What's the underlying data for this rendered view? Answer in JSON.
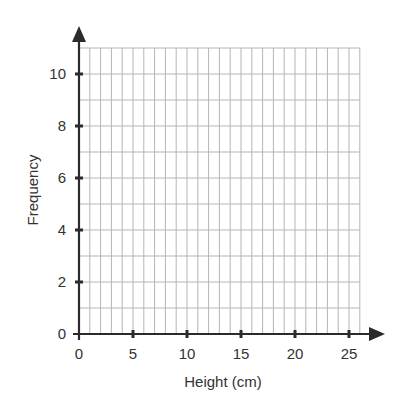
{
  "chart_data": {
    "type": "bar",
    "title": "",
    "xlabel": "Height (cm)",
    "ylabel": "Frequency",
    "x_ticks": [
      0,
      5,
      10,
      15,
      20,
      25
    ],
    "y_ticks": [
      0,
      2,
      4,
      6,
      8,
      10
    ],
    "xlim": [
      0,
      26
    ],
    "ylim": [
      0,
      11
    ],
    "x_grid_step": 1,
    "y_grid_step": 1,
    "grid": true,
    "categories": [],
    "values": [],
    "note": "Blank grid for a frequency histogram; no data plotted"
  },
  "colors": {
    "axis": "#2b2b2b",
    "grid": "#b5b5b5",
    "text": "#333333",
    "background": "#ffffff"
  }
}
